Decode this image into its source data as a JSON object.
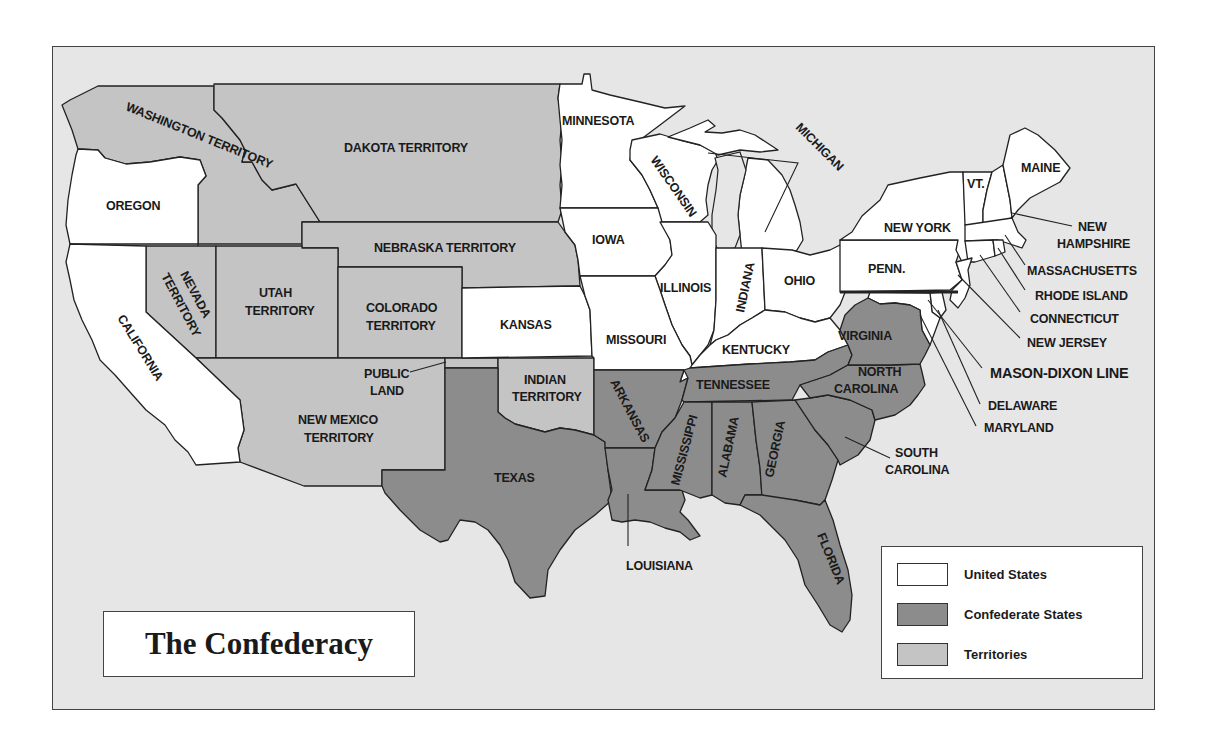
{
  "map": {
    "title": "The Confederacy",
    "colors": {
      "background": "#e6e6e6",
      "united_states": "#ffffff",
      "confederate_states": "#8c8c8c",
      "territories": "#c4c4c4",
      "border": "#222222"
    },
    "legend": [
      {
        "label": "United States",
        "color": "#ffffff"
      },
      {
        "label": "Confederate States",
        "color": "#8c8c8c"
      },
      {
        "label": "Territories",
        "color": "#c4c4c4"
      }
    ],
    "regions": {
      "united_states": [
        "Oregon",
        "California",
        "Minnesota",
        "Wisconsin",
        "Michigan",
        "Iowa",
        "Illinois",
        "Indiana",
        "Ohio",
        "Kansas",
        "Missouri",
        "Kentucky",
        "New York",
        "Penn.",
        "Vt.",
        "Maine",
        "New Hampshire",
        "Massachusetts",
        "Rhode Island",
        "Connecticut",
        "New Jersey",
        "Delaware",
        "Maryland"
      ],
      "confederate_states": [
        "Texas",
        "Arkansas",
        "Louisiana",
        "Tennessee",
        "Mississippi",
        "Alabama",
        "Georgia",
        "Florida",
        "South Carolina",
        "North Carolina",
        "Virginia"
      ],
      "territories": [
        "Washington Territory",
        "Dakota Territory",
        "Nebraska Territory",
        "Nevada Territory",
        "Utah Territory",
        "Colorado Territory",
        "New Mexico Territory",
        "Indian Territory",
        "Public Land"
      ]
    },
    "labels": {
      "washington": "WASHINGTON TERRITORY",
      "oregon": "OREGON",
      "california": "CALIFORNIA",
      "nevada_1": "NEVADA",
      "nevada_2": "TERRITORY",
      "utah_1": "UTAH",
      "utah_2": "TERRITORY",
      "colorado_1": "COLORADO",
      "colorado_2": "TERRITORY",
      "dakota": "DAKOTA TERRITORY",
      "nebraska": "NEBRASKA TERRITORY",
      "new_mexico_1": "NEW MEXICO",
      "new_mexico_2": "TERRITORY",
      "public_land_1": "PUBLIC",
      "public_land_2": "LAND",
      "kansas": "KANSAS",
      "indian_1": "INDIAN",
      "indian_2": "TERRITORY",
      "texas": "TEXAS",
      "minnesota": "MINNESOTA",
      "wisconsin": "WISCONSIN",
      "michigan": "MICHIGAN",
      "iowa": "IOWA",
      "illinois": "ILLINOIS",
      "indiana": "INDIANA",
      "ohio": "OHIO",
      "missouri": "MISSOURI",
      "kentucky": "KENTUCKY",
      "arkansas": "ARKANSAS",
      "louisiana": "LOUISIANA",
      "tennessee": "TENNESSEE",
      "mississippi": "MISSISSIPPI",
      "alabama": "ALABAMA",
      "georgia": "GEORGIA",
      "florida": "FLORIDA",
      "south_carolina_1": "SOUTH",
      "south_carolina_2": "CAROLINA",
      "north_carolina_1": "NORTH",
      "north_carolina_2": "CAROLINA",
      "virginia": "VIRGINIA",
      "penn": "PENN.",
      "new_york": "NEW YORK",
      "vt": "VT.",
      "maine": "MAINE",
      "new_hampshire_1": "NEW",
      "new_hampshire_2": "HAMPSHIRE",
      "massachusetts": "MASSACHUSETTS",
      "rhode_island": "RHODE ISLAND",
      "connecticut": "CONNECTICUT",
      "new_jersey": "NEW JERSEY",
      "mason_dixon": "MASON-DIXON LINE",
      "delaware": "DELAWARE",
      "maryland": "MARYLAND"
    }
  }
}
